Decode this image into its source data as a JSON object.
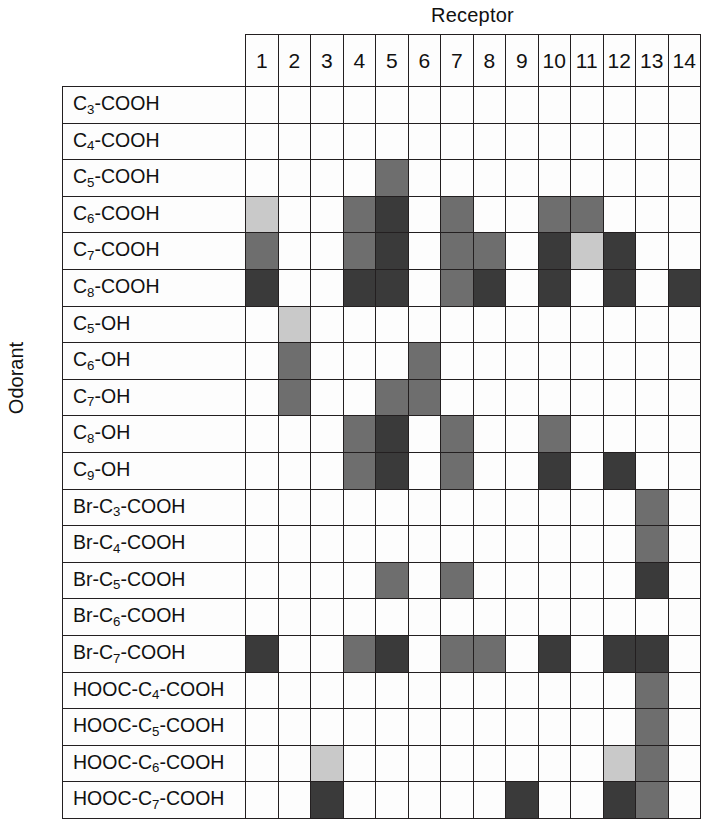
{
  "axis": {
    "x_title": "Receptor",
    "y_title": "Odorant"
  },
  "chart_data": {
    "type": "heatmap",
    "title": "Receptor",
    "xlabel": "Receptor",
    "ylabel": "Odorant",
    "grid": true,
    "legend": "none",
    "value_scale": {
      "levels": [
        0,
        1,
        2,
        3,
        4
      ],
      "colors": [
        "#fdfdfd",
        "#c9c9c9",
        "#969696",
        "#6e6e6e",
        "#3a3a3a"
      ],
      "labels": [
        "none",
        "weak",
        "moderate",
        "strong",
        "very strong"
      ]
    },
    "x_categories": [
      "1",
      "2",
      "3",
      "4",
      "5",
      "6",
      "7",
      "8",
      "9",
      "10",
      "11",
      "12",
      "13",
      "14"
    ],
    "y_categories": [
      "C3-COOH",
      "C4-COOH",
      "C5-COOH",
      "C6-COOH",
      "C7-COOH",
      "C8-COOH",
      "C5-OH",
      "C6-OH",
      "C7-OH",
      "C8-OH",
      "C9-OH",
      "Br-C3-COOH",
      "Br-C4-COOH",
      "Br-C5-COOH",
      "Br-C6-COOH",
      "Br-C7-COOH",
      "HOOC-C4-COOH",
      "HOOC-C5-COOH",
      "HOOC-C6-COOH",
      "HOOC-C7-COOH"
    ],
    "values": [
      [
        0,
        0,
        0,
        0,
        0,
        0,
        0,
        0,
        0,
        0,
        0,
        0,
        0,
        0
      ],
      [
        0,
        0,
        0,
        0,
        0,
        0,
        0,
        0,
        0,
        0,
        0,
        0,
        0,
        0
      ],
      [
        0,
        0,
        0,
        0,
        3,
        0,
        0,
        0,
        0,
        0,
        0,
        0,
        0,
        0
      ],
      [
        1,
        0,
        0,
        3,
        4,
        0,
        3,
        0,
        0,
        3,
        3,
        0,
        0,
        0
      ],
      [
        3,
        0,
        0,
        3,
        4,
        0,
        3,
        3,
        0,
        4,
        1,
        4,
        0,
        0
      ],
      [
        4,
        0,
        0,
        4,
        4,
        0,
        3,
        4,
        0,
        4,
        0,
        4,
        0,
        4
      ],
      [
        0,
        1,
        0,
        0,
        0,
        0,
        0,
        0,
        0,
        0,
        0,
        0,
        0,
        0
      ],
      [
        0,
        3,
        0,
        0,
        0,
        3,
        0,
        0,
        0,
        0,
        0,
        0,
        0,
        0
      ],
      [
        0,
        3,
        0,
        0,
        3,
        3,
        0,
        0,
        0,
        0,
        0,
        0,
        0,
        0
      ],
      [
        0,
        0,
        0,
        3,
        4,
        0,
        3,
        0,
        0,
        3,
        0,
        0,
        0,
        0
      ],
      [
        0,
        0,
        0,
        3,
        4,
        0,
        3,
        0,
        0,
        4,
        0,
        4,
        0,
        0
      ],
      [
        0,
        0,
        0,
        0,
        0,
        0,
        0,
        0,
        0,
        0,
        0,
        0,
        3,
        0
      ],
      [
        0,
        0,
        0,
        0,
        0,
        0,
        0,
        0,
        0,
        0,
        0,
        0,
        3,
        0
      ],
      [
        0,
        0,
        0,
        0,
        3,
        0,
        3,
        0,
        0,
        0,
        0,
        0,
        4,
        0
      ],
      [
        0,
        0,
        0,
        0,
        0,
        0,
        0,
        0,
        0,
        0,
        0,
        0,
        0,
        0
      ],
      [
        4,
        0,
        0,
        3,
        4,
        0,
        3,
        3,
        0,
        4,
        0,
        4,
        4,
        0
      ],
      [
        0,
        0,
        0,
        0,
        0,
        0,
        0,
        0,
        0,
        0,
        0,
        0,
        3,
        0
      ],
      [
        0,
        0,
        0,
        0,
        0,
        0,
        0,
        0,
        0,
        0,
        0,
        0,
        3,
        0
      ],
      [
        0,
        0,
        1,
        0,
        0,
        0,
        0,
        0,
        0,
        0,
        0,
        1,
        3,
        0
      ],
      [
        0,
        0,
        4,
        0,
        0,
        0,
        0,
        0,
        4,
        0,
        0,
        4,
        3,
        0
      ]
    ],
    "y_categories_html": [
      "C<sub>3</sub>-COOH",
      "C<sub>4</sub>-COOH",
      "C<sub>5</sub>-COOH",
      "C<sub>6</sub>-COOH",
      "C<sub>7</sub>-COOH",
      "C<sub>8</sub>-COOH",
      "C<sub>5</sub>-OH",
      "C<sub>6</sub>-OH",
      "C<sub>7</sub>-OH",
      "C<sub>8</sub>-OH",
      "C<sub>9</sub>-OH",
      "Br-C<sub>3</sub>-COOH",
      "Br-C<sub>4</sub>-COOH",
      "Br-C<sub>5</sub>-COOH",
      "Br-C<sub>6</sub>-COOH",
      "Br-C<sub>7</sub>-COOH",
      "HOOC-C<sub>4</sub>-COOH",
      "HOOC-C<sub>5</sub>-COOH",
      "HOOC-C<sub>6</sub>-COOH",
      "HOOC-C<sub>7</sub>-COOH"
    ]
  }
}
